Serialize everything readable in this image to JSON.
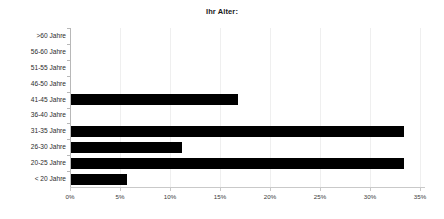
{
  "chart_data": {
    "type": "bar",
    "orientation": "horizontal",
    "title": "Ihr Alter:",
    "xlabel": "",
    "ylabel": "",
    "categories": [
      "< 20 Jahre",
      "20-25 Jahre",
      "26-30 Jahre",
      "31-35 Jahre",
      "36-40 Jahre",
      "41-45 Jahre",
      "46-50 Jahre",
      "51-55 Jahre",
      "56-60 Jahre",
      ">60 Jahre"
    ],
    "values": [
      5.6,
      33.3,
      11.1,
      33.3,
      0,
      16.7,
      0,
      0,
      0,
      0
    ],
    "xlim": [
      0,
      35
    ],
    "xticks": [
      0,
      5,
      10,
      15,
      20,
      25,
      30,
      35
    ],
    "xtick_labels": [
      "0%",
      "5%",
      "10%",
      "15%",
      "20%",
      "25%",
      "30%",
      "35%"
    ],
    "grid": true,
    "legend": false,
    "bar_color": "#000000",
    "axis_color": "#b8b8b8",
    "background": "#ffffff"
  }
}
